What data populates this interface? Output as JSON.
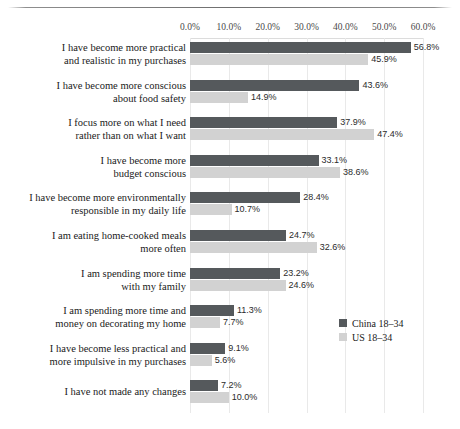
{
  "chart_data": {
    "type": "bar",
    "orientation": "horizontal",
    "title": "CONSUMERS",
    "xlabel": "",
    "ylabel": "",
    "xlim": [
      0,
      60
    ],
    "xticks": [
      "0.0%",
      "10.0%",
      "20.0%",
      "30.0%",
      "40.0%",
      "50.0%",
      "60.0%"
    ],
    "xtick_values": [
      0,
      10,
      20,
      30,
      40,
      50,
      60
    ],
    "grid": true,
    "legend_position": "right-lower",
    "categories": [
      "I have become more practical and realistic in my purchases",
      "I have become more conscious about food safety",
      "I focus more on what I need rather than on what I want",
      "I have become more budget conscious",
      "I have become more environmentally responsible in my daily life",
      "I am eating home-cooked meals more often",
      "I am spending more time with my family",
      "I am spending more time and money on decorating my home",
      "I have become less practical and more impulsive in my purchases",
      "I have not made any changes"
    ],
    "category_lines": [
      [
        "I have become more practical",
        "and realistic in my purchases"
      ],
      [
        "I have become more conscious",
        "about food safety"
      ],
      [
        "I focus more on what I need",
        "rather than on what I want"
      ],
      [
        "I have become more",
        "budget conscious"
      ],
      [
        "I have become more environmentally",
        "responsible in my daily life"
      ],
      [
        "I am eating home-cooked meals",
        "more often"
      ],
      [
        "I am spending more time",
        "with my family"
      ],
      [
        "I am spending more time and",
        "money on decorating my home"
      ],
      [
        "I have become less practical and",
        "more impulsive in my purchases"
      ],
      [
        "I have not made any changes"
      ]
    ],
    "series": [
      {
        "name": "China 18–34",
        "color": "#55595c",
        "values": [
          56.8,
          43.6,
          37.9,
          33.1,
          28.4,
          24.7,
          23.2,
          11.3,
          9.1,
          7.2
        ],
        "labels": [
          "56.8%",
          "43.6%",
          "37.9%",
          "33.1%",
          "28.4%",
          "24.7%",
          "23.2%",
          "11.3%",
          "9.1%",
          "7.2%"
        ]
      },
      {
        "name": "US 18–34",
        "color": "#d2d2d2",
        "values": [
          45.9,
          14.9,
          47.4,
          38.6,
          10.7,
          32.6,
          24.6,
          7.7,
          5.6,
          10.0
        ],
        "labels": [
          "45.9%",
          "14.9%",
          "47.4%",
          "38.6%",
          "10.7%",
          "32.6%",
          "24.6%",
          "7.7%",
          "5.6%",
          "10.0%"
        ]
      }
    ]
  }
}
